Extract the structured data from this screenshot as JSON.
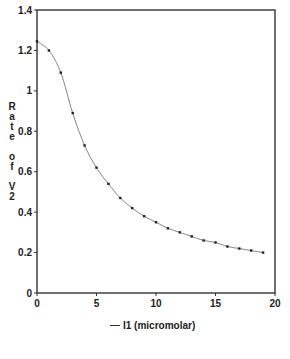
{
  "chart_data": {
    "type": "line",
    "title": "",
    "xlabel": "",
    "ylabel": "Rate of V2",
    "ylabel_stacked": [
      "R",
      "a",
      "t",
      "e",
      "",
      "o",
      "f",
      "",
      "V",
      "2"
    ],
    "xlim": [
      0,
      20
    ],
    "ylim": [
      0,
      1.4
    ],
    "x_ticks": [
      "0",
      "5",
      "10",
      "15",
      "20"
    ],
    "y_ticks": [
      "0",
      "0.2",
      "0.4",
      "0.6",
      "0.8",
      "1",
      "1.2",
      "1.4"
    ],
    "grid": false,
    "legend_position": "bottom",
    "series": [
      {
        "name": "I1 (micromolar)",
        "x": [
          0,
          1,
          2,
          3,
          4,
          5,
          6,
          7,
          8,
          9,
          10,
          11,
          12,
          13,
          14,
          15,
          16,
          17,
          18,
          19
        ],
        "values": [
          1.245,
          1.2,
          1.09,
          0.89,
          0.73,
          0.62,
          0.54,
          0.47,
          0.42,
          0.38,
          0.35,
          0.32,
          0.3,
          0.28,
          0.26,
          0.25,
          0.23,
          0.22,
          0.21,
          0.2
        ]
      }
    ]
  },
  "legend": {
    "label": "I1 (micromolar)"
  },
  "colors": {
    "line": "#777777",
    "marker": "#222222",
    "axis": "#333333"
  }
}
